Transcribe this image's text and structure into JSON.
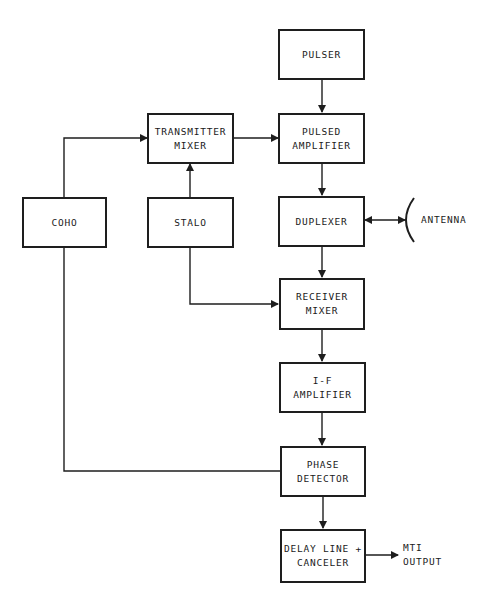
{
  "diagram": {
    "blocks": {
      "pulser": {
        "line1": "PULSER",
        "line2": ""
      },
      "pulsed_amplifier": {
        "line1": "PULSED",
        "line2": "AMPLIFIER"
      },
      "transmitter_mixer": {
        "line1": "TRANSMITTER",
        "line2": "MIXER"
      },
      "coho": {
        "line1": "COHO",
        "line2": ""
      },
      "stalo": {
        "line1": "STALO",
        "line2": ""
      },
      "duplexer": {
        "line1": "DUPLEXER",
        "line2": ""
      },
      "receiver_mixer": {
        "line1": "RECEIVER",
        "line2": "MIXER"
      },
      "if_amplifier": {
        "line1": "I-F",
        "line2": "AMPLIFIER"
      },
      "phase_detector": {
        "line1": "PHASE",
        "line2": "DETECTOR"
      },
      "delay_line_canceler": {
        "line1": "DELAY LINE +",
        "line2": "CANCELER"
      }
    },
    "labels": {
      "antenna": "ANTENNA",
      "output_line1": "MTI",
      "output_line2": "OUTPUT"
    },
    "connections": [
      {
        "from": "PULSER",
        "to": "PULSED AMPLIFIER"
      },
      {
        "from": "TRANSMITTER MIXER",
        "to": "PULSED AMPLIFIER"
      },
      {
        "from": "COHO",
        "to": "TRANSMITTER MIXER"
      },
      {
        "from": "STALO",
        "to": "TRANSMITTER MIXER"
      },
      {
        "from": "PULSED AMPLIFIER",
        "to": "DUPLEXER"
      },
      {
        "from": "DUPLEXER",
        "to": "ANTENNA",
        "bidirectional": true
      },
      {
        "from": "DUPLEXER",
        "to": "RECEIVER MIXER"
      },
      {
        "from": "STALO",
        "to": "RECEIVER MIXER"
      },
      {
        "from": "RECEIVER MIXER",
        "to": "I-F AMPLIFIER"
      },
      {
        "from": "I-F AMPLIFIER",
        "to": "PHASE DETECTOR"
      },
      {
        "from": "COHO",
        "to": "PHASE DETECTOR"
      },
      {
        "from": "PHASE DETECTOR",
        "to": "DELAY LINE + CANCELER"
      },
      {
        "from": "DELAY LINE + CANCELER",
        "to": "MTI OUTPUT"
      }
    ],
    "colors": {
      "line": "#1e1e1e",
      "background": "#ffffff"
    }
  }
}
